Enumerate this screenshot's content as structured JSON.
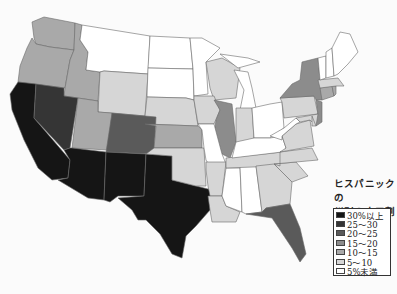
{
  "title_lines": [
    "ヒスパニックの",
    "州別の人口割合"
  ],
  "legend": [
    {
      "label": "30%以上",
      "color": "#151515"
    },
    {
      "label": "25～30",
      "color": "#353535"
    },
    {
      "label": "20～25",
      "color": "#5a5a5a"
    },
    {
      "label": "15～20",
      "color": "#8c8c8c"
    },
    {
      "label": "10～15",
      "color": "#a9a9a9"
    },
    {
      "label": "5～10",
      "color": "#d6d6d6"
    },
    {
      "label": "5%未満",
      "color": "#ffffff"
    }
  ],
  "states": {
    "WA": "10～15",
    "OR": "10～15",
    "ID": "10～15",
    "MT": "5%未満",
    "WY": "5～10",
    "ND": "5%未満",
    "SD": "5%未満",
    "NE": "5～10",
    "MN": "5%未満",
    "WI": "5～10",
    "MI": "5%未満",
    "IA": "5～10",
    "IL": "15～20",
    "IN": "5～10",
    "OH": "5%未満",
    "CA": "30%以上",
    "NV": "25～30",
    "UT": "10～15",
    "CO": "20～25",
    "AZ": "30%以上",
    "NM": "30%以上",
    "TX": "30%以上",
    "KS": "10～15",
    "OK": "5～10",
    "MO": "5%未満",
    "AR": "5～10",
    "LA": "5～10",
    "MS": "5%未満",
    "AL": "5%未満",
    "TN": "5～10",
    "KY": "5%未満",
    "GA": "5～10",
    "FL": "20～25",
    "SC": "5～10",
    "NC": "5～10",
    "VA": "5～10",
    "WV": "5%未満",
    "PA": "5～10",
    "NY": "15～20",
    "NJ": "15～20",
    "CT": "10～15",
    "RI": "10～15",
    "MA": "5～10",
    "VT": "5%未満",
    "NH": "5%未満",
    "ME": "5%未満",
    "MD": "5～10",
    "DE": "5～10"
  }
}
